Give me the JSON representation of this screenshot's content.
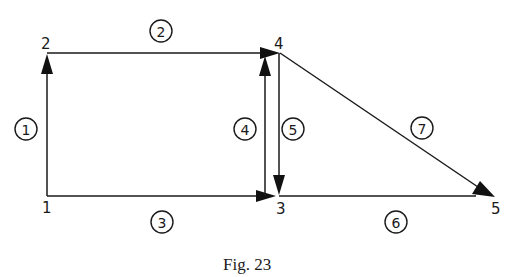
{
  "figure": {
    "caption": "Fig. 23",
    "colors": {
      "ink": "#1a1a1a",
      "background": "#ffffff"
    }
  },
  "nodes": [
    {
      "id": "1",
      "label": "1"
    },
    {
      "id": "2",
      "label": "2"
    },
    {
      "id": "3",
      "label": "3"
    },
    {
      "id": "4",
      "label": "4"
    },
    {
      "id": "5",
      "label": "5"
    }
  ],
  "edges": [
    {
      "id": "1",
      "label": "1",
      "from": "1",
      "to": "2"
    },
    {
      "id": "2",
      "label": "2",
      "from": "2",
      "to": "4"
    },
    {
      "id": "3",
      "label": "3",
      "from": "1",
      "to": "3"
    },
    {
      "id": "4",
      "label": "4",
      "from": "3",
      "to": "4"
    },
    {
      "id": "5",
      "label": "5",
      "from": "4",
      "to": "3"
    },
    {
      "id": "6",
      "label": "6",
      "from": "3",
      "to": "5"
    },
    {
      "id": "7",
      "label": "7",
      "from": "4",
      "to": "5"
    }
  ]
}
